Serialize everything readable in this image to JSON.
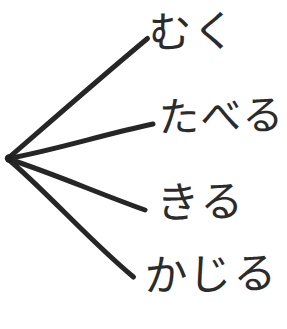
{
  "diagram": {
    "type": "radial-branch-tree",
    "title": "",
    "style": "hand-drawn",
    "background_color": "#ffffff",
    "ink_color": "#262626",
    "root": {
      "label": "",
      "x": 8,
      "y": 158
    },
    "branches": [
      {
        "id": "branch-muku",
        "label": "むく",
        "romaji": "muku",
        "end_x": 148,
        "end_y": 38,
        "stroke_width": 5
      },
      {
        "id": "branch-taberu",
        "label": "たべる",
        "romaji": "taberu",
        "end_x": 153,
        "end_y": 124,
        "stroke_width": 5
      },
      {
        "id": "branch-kiru",
        "label": "きる",
        "romaji": "kiru",
        "end_x": 145,
        "end_y": 210,
        "stroke_width": 5
      },
      {
        "id": "branch-kajiru",
        "label": "かじる",
        "romaji": "kajiru",
        "end_x": 133,
        "end_y": 277,
        "stroke_width": 5
      }
    ]
  }
}
